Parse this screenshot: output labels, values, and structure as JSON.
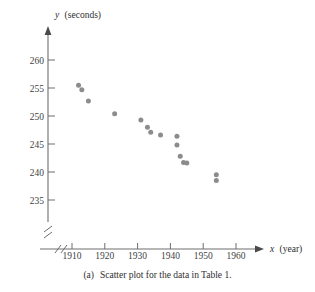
{
  "figure": {
    "caption_index": "(a)",
    "caption_text": "Scatter plot for the data in Table 1.",
    "point_color": "#8c8c8c",
    "axis_color": "#6e6e6e"
  },
  "chart_data": {
    "type": "scatter",
    "title": "",
    "xlabel_var": "x",
    "xlabel_unit": "(year)",
    "ylabel_var": "y",
    "ylabel_unit": "(seconds)",
    "xlabel": "x (year)",
    "ylabel": "y (seconds)",
    "xlim": [
      1906,
      1966
    ],
    "ylim": [
      233,
      262
    ],
    "xticks": [
      1910,
      1920,
      1930,
      1940,
      1950,
      1960
    ],
    "yticks": [
      235,
      240,
      245,
      250,
      255,
      260
    ],
    "xtick_labels": [
      "1910",
      "1920",
      "1930",
      "1940",
      "1950",
      "1960"
    ],
    "ytick_labels": [
      "235",
      "240",
      "245",
      "250",
      "255",
      "260"
    ],
    "grid": false,
    "legend": "none",
    "axis_break_x": true,
    "axis_break_y": true,
    "x": [
      1912,
      1913,
      1915,
      1923,
      1931,
      1933,
      1934,
      1937,
      1942,
      1942,
      1943,
      1944,
      1945,
      1954,
      1954
    ],
    "y": [
      255.5,
      254.7,
      252.7,
      250.4,
      249.3,
      248.0,
      247.1,
      246.6,
      246.4,
      244.8,
      242.8,
      241.7,
      241.6,
      239.5,
      238.5
    ],
    "points": [
      {
        "x": 1912,
        "y": 255.5
      },
      {
        "x": 1913,
        "y": 254.7
      },
      {
        "x": 1915,
        "y": 252.7
      },
      {
        "x": 1923,
        "y": 250.4
      },
      {
        "x": 1931,
        "y": 249.3
      },
      {
        "x": 1933,
        "y": 248.0
      },
      {
        "x": 1934,
        "y": 247.1
      },
      {
        "x": 1937,
        "y": 246.6
      },
      {
        "x": 1942,
        "y": 246.4
      },
      {
        "x": 1942,
        "y": 244.8
      },
      {
        "x": 1943,
        "y": 242.8
      },
      {
        "x": 1944,
        "y": 241.7
      },
      {
        "x": 1945,
        "y": 241.6
      },
      {
        "x": 1954,
        "y": 239.5
      },
      {
        "x": 1954,
        "y": 238.5
      }
    ]
  }
}
